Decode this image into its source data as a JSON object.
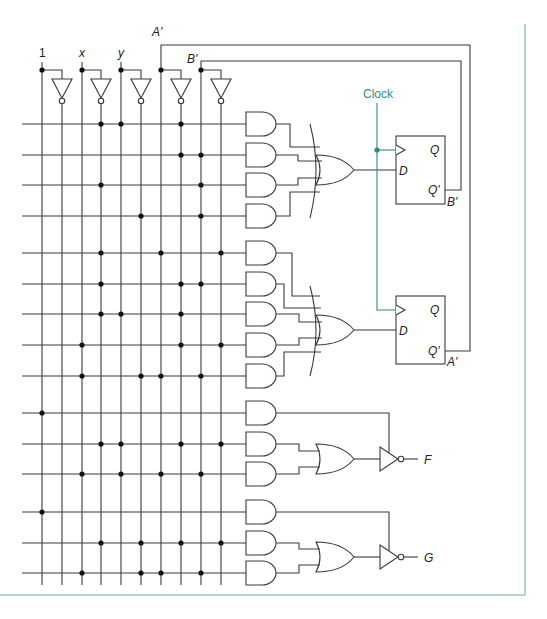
{
  "diagram": {
    "colors": {
      "wire": "#3a3a3a",
      "clock": "#2a8a8c",
      "frame": "#9cc7cf",
      "dot": "#111111"
    },
    "inputs": [
      {
        "label": "1",
        "x": 42,
        "inv_x": 62
      },
      {
        "label": "x",
        "x": 82,
        "inv_x": 101
      },
      {
        "label": "y",
        "x": 121,
        "inv_x": 141
      },
      {
        "label": "A'",
        "x": 161,
        "inv_x": 181
      },
      {
        "label": "B'",
        "x": 201,
        "inv_x": 221
      }
    ],
    "columns_x": [
      42,
      62,
      82,
      101,
      121,
      141,
      161,
      181,
      201,
      221
    ],
    "rows": [
      {
        "y": 124,
        "dots": [
          101,
          121,
          181
        ]
      },
      {
        "y": 155,
        "dots": [
          181,
          201
        ]
      },
      {
        "y": 185,
        "dots": [
          101,
          201
        ]
      },
      {
        "y": 216,
        "dots": [
          141,
          201
        ]
      },
      {
        "y": 253,
        "dots": [
          101,
          161,
          221
        ]
      },
      {
        "y": 284,
        "dots": [
          101,
          181,
          201
        ]
      },
      {
        "y": 314,
        "dots": [
          101,
          121,
          181
        ]
      },
      {
        "y": 345,
        "dots": [
          82,
          181,
          221
        ]
      },
      {
        "y": 376,
        "dots": [
          82,
          141,
          161,
          201
        ]
      },
      {
        "y": 413,
        "dots": [
          42
        ]
      },
      {
        "y": 444,
        "dots": [
          101,
          121,
          181,
          221
        ]
      },
      {
        "y": 474,
        "dots": [
          82,
          121,
          161,
          201
        ]
      },
      {
        "y": 512,
        "dots": [
          42
        ]
      },
      {
        "y": 543,
        "dots": [
          101,
          141,
          181,
          221
        ]
      },
      {
        "y": 573,
        "dots": [
          82,
          141,
          161,
          201
        ]
      }
    ],
    "flipflops": [
      {
        "name": "B",
        "d_label": "D",
        "q_label": "Q",
        "qn_label": "Q'",
        "out_label": "B'",
        "box": [
          396,
          136,
          49,
          68
        ],
        "d_y": 170,
        "clk_y": 150,
        "q_y": 150,
        "qn_y": 190
      },
      {
        "name": "A",
        "d_label": "D",
        "q_label": "Q",
        "qn_label": "Q'",
        "out_label": "A'",
        "box": [
          396,
          296,
          49,
          68
        ],
        "d_y": 330,
        "clk_y": 310,
        "q_y": 310,
        "qn_y": 351
      }
    ],
    "clock": {
      "label": "Clock"
    },
    "feedback": [
      {
        "label": "A'",
        "y": 45,
        "x_right": 470
      },
      {
        "label": "B'",
        "y": 61,
        "x_right": 461
      }
    ],
    "outputs": [
      {
        "label": "F",
        "y": 459
      },
      {
        "label": "G",
        "y": 557
      }
    ]
  }
}
